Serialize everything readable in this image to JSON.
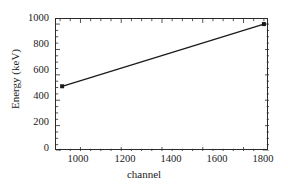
{
  "chart_data": {
    "type": "line",
    "title": "",
    "xlabel": "channel",
    "ylabel": "Energy (keV)",
    "xlim": [
      880,
      1925
    ],
    "ylim": [
      0,
      1040
    ],
    "xticks": [
      1000,
      1200,
      1400,
      1600,
      1800
    ],
    "yticks": [
      0,
      200,
      400,
      600,
      800,
      1000
    ],
    "xtick_labels": [
      "1000",
      "1200",
      "1400",
      "1600",
      "1800"
    ],
    "ytick_labels": [
      "0",
      "200",
      "400",
      "600",
      "800",
      "1000"
    ],
    "minor_ticks": true,
    "grid": false,
    "legend": null,
    "series": [
      {
        "name": "energy calibration",
        "marker": "filled-square",
        "line_style": "solid",
        "color": "#1a1a1a",
        "x": [
          910,
          1900
        ],
        "y": [
          510,
          1000
        ]
      }
    ],
    "annotations": []
  },
  "figure": {
    "background_color": "#ffffff",
    "axis_color": "#2b2b2b",
    "text_color": "#1a1a1a"
  }
}
